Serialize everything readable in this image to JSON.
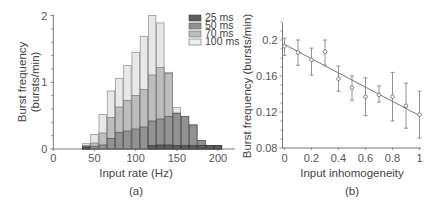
{
  "chart_data": [
    {
      "panel": "(a)",
      "type": "bar",
      "subtype": "overlaid histogram",
      "title": "",
      "xlabel": "Input rate (Hz)",
      "ylabel": "Burst frequency (bursts/min)",
      "ylabel_lines": [
        "Burst frequency",
        "(bursts/min)"
      ],
      "xlim": [
        0,
        220
      ],
      "ylim": [
        0,
        2
      ],
      "xticks": [
        0,
        50,
        100,
        150,
        200
      ],
      "yticks": [
        0,
        1,
        2
      ],
      "grid": false,
      "legend_position": "upper right",
      "bin_width": 10,
      "categories": [
        40,
        50,
        60,
        70,
        80,
        90,
        100,
        110,
        120,
        130,
        140,
        150,
        160,
        170,
        180,
        190,
        200
      ],
      "series": [
        {
          "name": "100 ms",
          "color": "#e8e8e8",
          "values": [
            0.08,
            0.22,
            0.52,
            0.87,
            1.06,
            1.25,
            1.45,
            1.69,
            2.0,
            1.89,
            1.15,
            0.62,
            0.49,
            0.36,
            0.13,
            0.05,
            0.05
          ]
        },
        {
          "name": "70 ms",
          "color": "#bdbdbd",
          "values": [
            0.05,
            0.09,
            0.24,
            0.47,
            0.63,
            0.73,
            0.8,
            0.89,
            1.11,
            1.22,
            1.13,
            0.54,
            0.49,
            0.36,
            0.13,
            0.05,
            0.05
          ]
        },
        {
          "name": "50 ms",
          "color": "#929292",
          "values": [
            0.04,
            0.04,
            0.06,
            0.16,
            0.25,
            0.27,
            0.3,
            0.33,
            0.42,
            0.45,
            0.49,
            0.53,
            0.49,
            0.36,
            0.13,
            0.05,
            0.05
          ]
        },
        {
          "name": "25 ms",
          "color": "#5e5e5e",
          "values": [
            0.02,
            0,
            0,
            0,
            0,
            0,
            0,
            0,
            0.05,
            0.06,
            0.06,
            0.05,
            0.05,
            0.05,
            0.05,
            0.05,
            0.05
          ]
        }
      ]
    },
    {
      "panel": "(b)",
      "type": "scatter",
      "subtype": "error bars with linear fit",
      "title": "",
      "xlabel": "Input inhomogeneity",
      "ylabel": "Burst frequency (bursts/min)",
      "xlim": [
        0,
        1
      ],
      "ylim": [
        0.08,
        0.22
      ],
      "xticks": [
        0,
        0.2,
        0.4,
        0.6,
        0.8,
        1
      ],
      "xtick_labels": [
        "0",
        "0.2",
        "0.4",
        "0.6",
        "0.8",
        "1"
      ],
      "yticks": [
        0.08,
        0.12,
        0.16,
        0.2
      ],
      "ytick_labels": [
        "0.08",
        "0.12",
        "0.16",
        "0.2"
      ],
      "grid": false,
      "x": [
        0,
        0.1,
        0.2,
        0.3,
        0.4,
        0.5,
        0.6,
        0.7,
        0.8,
        0.9,
        1.0
      ],
      "y": [
        0.193,
        0.186,
        0.178,
        0.187,
        0.157,
        0.147,
        0.137,
        0.139,
        0.137,
        0.127,
        0.117
      ],
      "err_low": [
        0.183,
        0.172,
        0.161,
        0.172,
        0.143,
        0.133,
        0.116,
        0.131,
        0.11,
        0.102,
        0.091
      ],
      "err_high": [
        0.202,
        0.2,
        0.191,
        0.2,
        0.171,
        0.16,
        0.158,
        0.149,
        0.164,
        0.152,
        0.143
      ],
      "fit_line": {
        "x": [
          0,
          1
        ],
        "y": [
          0.195,
          0.116
        ]
      }
    }
  ],
  "panel_a": {
    "caption": "(a)",
    "xlabel": "Input rate (Hz)",
    "ylabel_line1": "Burst frequency",
    "ylabel_line2": "(bursts/min)",
    "legend": [
      "25 ms",
      "50 ms",
      "70 ms",
      "100 ms"
    ]
  },
  "panel_b": {
    "caption": "(b)",
    "xlabel": "Input inhomogeneity",
    "ylabel": "Burst frequency (bursts/min)"
  }
}
